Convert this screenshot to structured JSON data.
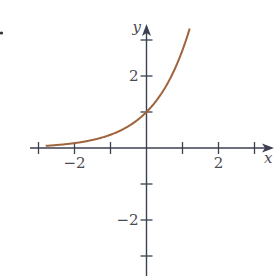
{
  "chart_data": {
    "type": "line",
    "title": "",
    "function": "y = e^x",
    "xlabel": "x",
    "ylabel": "y",
    "xlim": [
      -3,
      3.5
    ],
    "ylim": [
      -3.5,
      3.5
    ],
    "grid": false,
    "legend": null,
    "x_ticks": [
      -3,
      -2,
      -1,
      0,
      1,
      2,
      3
    ],
    "y_ticks": [
      -3,
      -2,
      -1,
      0,
      1,
      2,
      3
    ],
    "x_tick_labels": [
      {
        "value": -2,
        "label": "−2"
      },
      {
        "value": 2,
        "label": "2"
      }
    ],
    "y_tick_labels": [
      {
        "value": 2,
        "label": "2"
      },
      {
        "value": -2,
        "label": "−2"
      }
    ],
    "series": [
      {
        "name": "e^x",
        "color": "#a0643c",
        "x": [
          -2.8,
          -2.5,
          -2,
          -1.5,
          -1,
          -0.5,
          0,
          0.25,
          0.5,
          0.75,
          1,
          1.1,
          1.2
        ],
        "y": [
          0.061,
          0.082,
          0.135,
          0.223,
          0.368,
          0.607,
          1.0,
          1.284,
          1.649,
          2.117,
          2.718,
          3.004,
          3.32
        ]
      }
    ]
  },
  "style": {
    "axis_color": "#3c4050",
    "label_color": "#4a4a52",
    "curve_color": "#a0643c",
    "background": "#ffffff"
  },
  "layout": {
    "origin_px": [
      146.5,
      148
    ],
    "unit_px": 36
  }
}
